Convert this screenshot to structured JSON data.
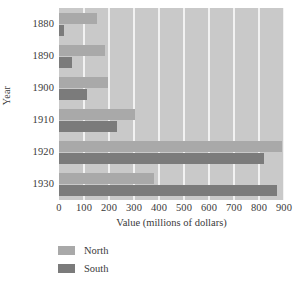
{
  "chart_data": {
    "type": "bar",
    "orientation": "horizontal",
    "title": "",
    "xlabel": "Value (millions of dollars)",
    "ylabel": "Year",
    "categories": [
      "1880",
      "1890",
      "1900",
      "1910",
      "1920",
      "1930"
    ],
    "series": [
      {
        "name": "North",
        "color": "#a9a9a9",
        "values": [
          150,
          185,
          195,
          305,
          890,
          380
        ]
      },
      {
        "name": "South",
        "color": "#7b7b7b",
        "values": [
          20,
          50,
          110,
          230,
          820,
          870
        ]
      }
    ],
    "xlim": [
      0,
      900
    ],
    "xticks": [
      0,
      100,
      200,
      300,
      400,
      500,
      600,
      700,
      800,
      900
    ],
    "xtick_labels": [
      "0",
      "100",
      "200",
      "300",
      "400",
      "500",
      "600",
      "700",
      "800",
      "900"
    ],
    "grid": "vertical-white",
    "plot_background": "#c9c9c9",
    "legend_position": "below-axis-left",
    "legend": [
      "North",
      "South"
    ]
  }
}
